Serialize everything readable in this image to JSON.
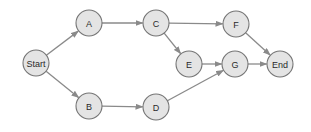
{
  "diagram": {
    "type": "directed-graph",
    "colors": {
      "node_fill": "#e4e4e4",
      "node_stroke": "#757575",
      "edge": "#8a8a8a",
      "text": "#2a2a2a"
    },
    "node_radius": 13,
    "nodes": [
      {
        "id": "start",
        "label": "Start",
        "x": 36,
        "y": 63
      },
      {
        "id": "a",
        "label": "A",
        "x": 89,
        "y": 23
      },
      {
        "id": "b",
        "label": "B",
        "x": 89,
        "y": 106
      },
      {
        "id": "c",
        "label": "C",
        "x": 156,
        "y": 23
      },
      {
        "id": "d",
        "label": "D",
        "x": 156,
        "y": 107
      },
      {
        "id": "e",
        "label": "E",
        "x": 189,
        "y": 64
      },
      {
        "id": "f",
        "label": "F",
        "x": 236,
        "y": 24
      },
      {
        "id": "g",
        "label": "G",
        "x": 235,
        "y": 64
      },
      {
        "id": "end",
        "label": "End",
        "x": 280,
        "y": 64
      }
    ],
    "edges": [
      {
        "from": "start",
        "to": "a"
      },
      {
        "from": "start",
        "to": "b"
      },
      {
        "from": "a",
        "to": "c"
      },
      {
        "from": "b",
        "to": "d"
      },
      {
        "from": "c",
        "to": "f"
      },
      {
        "from": "c",
        "to": "e"
      },
      {
        "from": "e",
        "to": "g"
      },
      {
        "from": "d",
        "to": "g"
      },
      {
        "from": "f",
        "to": "end"
      },
      {
        "from": "g",
        "to": "end"
      }
    ]
  }
}
